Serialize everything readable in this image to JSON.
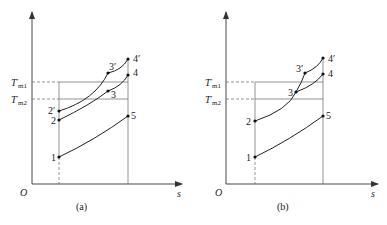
{
  "diagram": {
    "type": "T-s diagram",
    "panels": [
      {
        "id": "a",
        "caption": "(a)",
        "axis_labels": {
          "origin": "O",
          "x": "s"
        },
        "level_labels": {
          "tm1_main": "T",
          "tm1_prime": "′",
          "tm1_sub": "m1",
          "tm2_main": "T",
          "tm2_prime": "′",
          "tm2_sub": "m2"
        },
        "points": {
          "p1": "1",
          "p2": "2",
          "p2p": "2′",
          "p3": "3",
          "p3p": "3′",
          "p4": "4",
          "p4p": "4′",
          "p5": "5"
        }
      },
      {
        "id": "b",
        "caption": "(b)",
        "axis_labels": {
          "origin": "O",
          "x": "s"
        },
        "level_labels": {
          "tm1_main": "T",
          "tm1_prime": "′",
          "tm1_sub": "m1",
          "tm2_main": "T",
          "tm2_prime": "′",
          "tm2_sub": "m2"
        },
        "points": {
          "p1": "1",
          "p2": "2",
          "p3": "3",
          "p3p": "3′",
          "p4": "4",
          "p4p": "4′",
          "p5": "5"
        }
      }
    ]
  }
}
